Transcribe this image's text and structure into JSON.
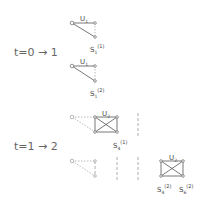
{
  "steps": [
    {
      "label": "t=0 → 1"
    },
    {
      "label": "t=1 → 2"
    }
  ],
  "graphs": [
    {
      "unit_label": "U",
      "unit_sub": "1",
      "state_label": "S",
      "state_sub": "1",
      "state_sup": "(1)"
    },
    {
      "unit_label": "U",
      "unit_sub": "1",
      "state_label": "S",
      "state_sub": "1",
      "state_sup": "(2)"
    },
    {
      "unit_label": "U",
      "unit_sub": "2",
      "state_label": "S",
      "state_sub": "4",
      "state_sup": "(1)"
    },
    {
      "unit_label": "U",
      "unit_sub": "2",
      "state_a_label": "S",
      "state_a_sub": "4",
      "state_a_sup": "(2)",
      "state_b_label": "S",
      "state_b_sub": "6",
      "state_b_sup": "(2)"
    }
  ]
}
